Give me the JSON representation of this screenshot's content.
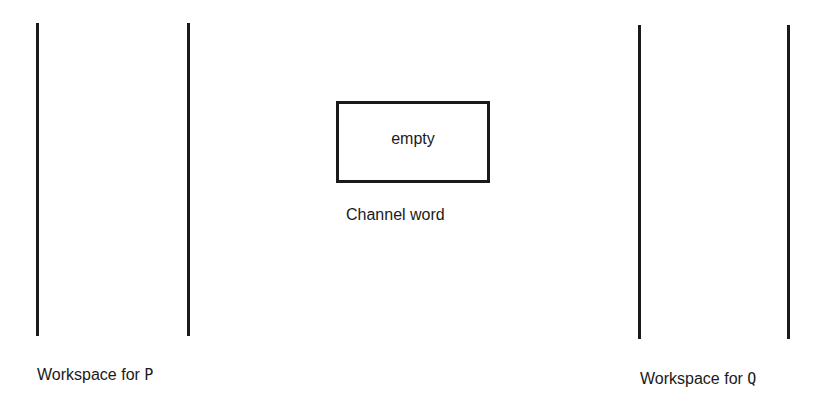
{
  "diagram": {
    "channel": {
      "value": "empty",
      "label": "Channel word"
    },
    "workspaces": [
      {
        "label_prefix": "Workspace for",
        "process": "P"
      },
      {
        "label_prefix": "Workspace for",
        "process": "Q"
      }
    ]
  },
  "colors": {
    "line": "#1a1a1a",
    "background": "#ffffff"
  }
}
